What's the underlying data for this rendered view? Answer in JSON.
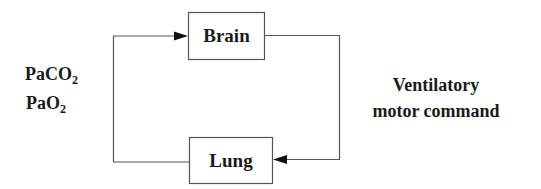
{
  "diagram": {
    "type": "feedback-loop",
    "nodes": [
      {
        "id": "brain",
        "label": "Brain"
      },
      {
        "id": "lung",
        "label": "Lung"
      }
    ],
    "edges": [
      {
        "from": "lung",
        "to": "brain",
        "label_lines": [
          "PaCO",
          "PaO"
        ],
        "label_subscripts": [
          "2",
          "2"
        ]
      },
      {
        "from": "brain",
        "to": "lung",
        "label_lines": [
          "Ventilatory",
          "motor command"
        ]
      }
    ],
    "colors": {
      "line": "#555555",
      "text": "#1a1a1a",
      "background": "#ffffff"
    }
  },
  "labels": {
    "brain": "Brain",
    "lung": "Lung",
    "left_1_main": "PaCO",
    "left_1_sub": "2",
    "left_2_main": "PaO",
    "left_2_sub": "2",
    "right_1": "Ventilatory",
    "right_2": "motor command"
  }
}
